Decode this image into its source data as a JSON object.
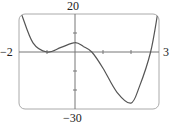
{
  "chart_data": {
    "type": "line",
    "title": "",
    "xlabel": "",
    "ylabel": "",
    "xlim": [
      -2,
      3
    ],
    "ylim": [
      -30,
      20
    ],
    "x_tick_labels": [
      "-2",
      "3"
    ],
    "y_tick_labels": [
      "20",
      "-30"
    ],
    "x_ticks": [
      -1,
      0,
      1,
      2
    ],
    "y_ticks": [
      -20,
      -10,
      0,
      10
    ],
    "grid": false,
    "legend": null,
    "series": [
      {
        "name": "f(x)",
        "description": "Quartic polynomial approx. 3(x+1)^2(x-0.6)(x-2.7)",
        "x": [
          -1.9,
          -1.5,
          -1.0,
          -0.5,
          0.0,
          0.3,
          0.6,
          1.0,
          1.5,
          2.0,
          2.3,
          2.7,
          2.95
        ],
        "values": [
          19.5,
          4.8,
          0.0,
          2.4,
          4.9,
          2.9,
          0.0,
          -8.5,
          -21.2,
          -26.9,
          -18.2,
          0.0,
          20.0
        ]
      }
    ],
    "annotations": [
      "local minimum touching x-axis near x = -1",
      "local maximum near (0, 5)",
      "x-intercepts near 0.6 and 2.7",
      "global minimum near (2.07, -27)"
    ]
  },
  "labels": {
    "ymax": "20",
    "ymin": "−30",
    "xmin": "−2",
    "xmax": "3"
  },
  "colors": {
    "curve": "#555555",
    "axes": "#777777",
    "frame": "#aaaaaa"
  }
}
